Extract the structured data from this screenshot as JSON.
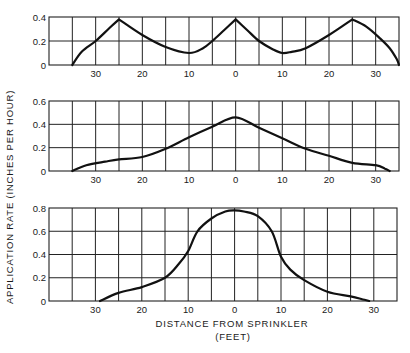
{
  "figure": {
    "ylabel": "APPLICATION  RATE  (INCHES  PER  HOUR)",
    "xlabel_line1": "DISTANCE  FROM  SPRINKLER",
    "xlabel_line2": "(FEET)",
    "line_color": "#111111",
    "grid_color": "#222222"
  },
  "chart_data": [
    {
      "type": "line",
      "title": "",
      "xlabel": "DISTANCE FROM SPRINKLER (FEET)",
      "ylabel": "APPLICATION RATE (INCHES PER HOUR)",
      "xlim": [
        -40,
        35
      ],
      "ylim": [
        0,
        0.4
      ],
      "grid": true,
      "x_ticks": [
        -30,
        -20,
        -10,
        0,
        10,
        20,
        30
      ],
      "x_tick_labels": [
        "30",
        "20",
        "10",
        "0",
        "10",
        "20",
        "30"
      ],
      "y_ticks": [
        0,
        0.2,
        0.4
      ],
      "y_tick_labels": [
        "0",
        "0.2",
        "0.4"
      ],
      "x": [
        -35,
        -33,
        -30,
        -27,
        -25,
        -20,
        -15,
        -10,
        -7,
        -5,
        -2.5,
        0,
        2.5,
        5,
        8,
        10,
        12,
        15,
        20,
        25,
        28,
        31,
        33,
        34.5,
        35
      ],
      "values": [
        0,
        0.11,
        0.2,
        0.31,
        0.38,
        0.25,
        0.15,
        0.1,
        0.14,
        0.2,
        0.29,
        0.38,
        0.29,
        0.2,
        0.13,
        0.1,
        0.11,
        0.14,
        0.25,
        0.38,
        0.32,
        0.22,
        0.14,
        0.05,
        0
      ]
    },
    {
      "type": "line",
      "title": "",
      "xlabel": "DISTANCE FROM SPRINKLER (FEET)",
      "ylabel": "APPLICATION RATE (INCHES PER HOUR)",
      "xlim": [
        -40,
        35
      ],
      "ylim": [
        0,
        0.6
      ],
      "grid": true,
      "x_ticks": [
        -30,
        -20,
        -10,
        0,
        10,
        20,
        30
      ],
      "x_tick_labels": [
        "30",
        "20",
        "10",
        "0",
        "10",
        "20",
        "30"
      ],
      "y_ticks": [
        0,
        0.2,
        0.4,
        0.6
      ],
      "y_tick_labels": [
        "0",
        "0.2",
        "0.4",
        "0.6"
      ],
      "x": [
        -35,
        -32,
        -28,
        -25,
        -20,
        -15,
        -10,
        -5,
        0,
        5,
        10,
        15,
        20,
        25,
        30,
        32,
        33
      ],
      "values": [
        0,
        0.05,
        0.08,
        0.1,
        0.12,
        0.19,
        0.29,
        0.38,
        0.46,
        0.37,
        0.28,
        0.19,
        0.13,
        0.07,
        0.05,
        0.02,
        0
      ]
    },
    {
      "type": "line",
      "title": "",
      "xlabel": "DISTANCE FROM SPRINKLER (FEET)",
      "ylabel": "APPLICATION RATE (INCHES PER HOUR)",
      "xlim": [
        -40,
        35
      ],
      "ylim": [
        0,
        0.8
      ],
      "grid": true,
      "x_ticks": [
        -30,
        -20,
        -10,
        0,
        10,
        20,
        30
      ],
      "x_tick_labels": [
        "30",
        "20",
        "10",
        "0",
        "10",
        "20",
        "30"
      ],
      "y_ticks": [
        0,
        0.2,
        0.4,
        0.6,
        0.8
      ],
      "y_tick_labels": [
        "0",
        "0.2",
        "0.4",
        "0.6",
        "0.8"
      ],
      "x": [
        -29,
        -25,
        -20,
        -15,
        -12,
        -10,
        -8,
        -5,
        -2,
        0,
        2,
        5,
        8,
        10,
        12,
        15,
        20,
        25,
        28,
        29
      ],
      "values": [
        0,
        0.07,
        0.12,
        0.2,
        0.32,
        0.43,
        0.6,
        0.71,
        0.77,
        0.78,
        0.77,
        0.73,
        0.6,
        0.38,
        0.27,
        0.18,
        0.08,
        0.04,
        0.01,
        0
      ]
    }
  ]
}
